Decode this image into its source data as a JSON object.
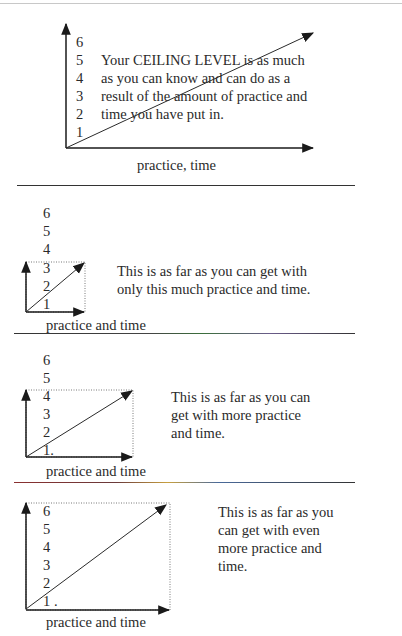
{
  "panel1": {
    "ticks": [
      "6",
      "5",
      "4",
      "3",
      "2",
      "1"
    ],
    "text_lines": [
      "Your CEILING LEVEL is as much",
      "as you can know and can do as a",
      "result of the amount of practice and",
      "time you have put in."
    ],
    "x_label": "practice, time"
  },
  "panel2": {
    "ticks": [
      "6",
      "5",
      "4",
      "3",
      "2",
      "1"
    ],
    "text_lines": [
      "This is as far as you can get with",
      "only this much practice and time."
    ],
    "x_label": "practice and time",
    "ceiling_level": 3
  },
  "panel3": {
    "ticks": [
      "6",
      "5",
      "4",
      "3",
      "2",
      "1."
    ],
    "text_lines": [
      "This is as far as you can",
      "get with more practice",
      "and time."
    ],
    "x_label": "practice and time",
    "ceiling_level": 4
  },
  "panel4": {
    "ticks": [
      "6",
      "5",
      "4",
      "3",
      "2",
      "1 ."
    ],
    "text_lines": [
      "This is as far as you",
      "can get with even",
      "more practice and",
      "time."
    ],
    "x_label": "practice and time",
    "ceiling_level": 6
  }
}
